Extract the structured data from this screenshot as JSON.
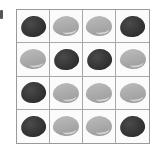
{
  "figure": {
    "label_mark": "|",
    "grid": {
      "rows": 4,
      "cols": 4,
      "colors": {
        "dark": "#333333",
        "light": "#aaaaaa",
        "border": "#9a9a9a"
      },
      "cells": [
        [
          "dark",
          "light",
          "light",
          "dark"
        ],
        [
          "light",
          "dark",
          "dark",
          "light"
        ],
        [
          "dark",
          "light",
          "light",
          "light"
        ],
        [
          "dark",
          "light",
          "light",
          "dark"
        ]
      ]
    }
  }
}
